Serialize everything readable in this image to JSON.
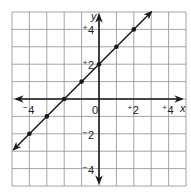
{
  "chart_data": {
    "type": "line",
    "title": "",
    "xlabel": "x",
    "ylabel": "y",
    "xlim": [
      -5,
      5
    ],
    "ylim": [
      -5,
      5
    ],
    "grid": true,
    "equation": "y = x + 2",
    "x_tick_labels": [
      {
        "value": -4,
        "sign": "−",
        "num": "4"
      },
      {
        "value": 0,
        "sign": "",
        "num": "0"
      },
      {
        "value": 2,
        "sign": "+",
        "num": "2"
      },
      {
        "value": 4,
        "sign": "+",
        "num": "4"
      }
    ],
    "y_tick_labels": [
      {
        "value": 4,
        "sign": "+",
        "num": "4"
      },
      {
        "value": 2,
        "sign": "+",
        "num": "2"
      },
      {
        "value": -2,
        "sign": "−",
        "num": "2"
      },
      {
        "value": -4,
        "sign": "−",
        "num": "4"
      }
    ],
    "series": [
      {
        "name": "line",
        "x": [
          -4,
          -3,
          -2,
          -1,
          0,
          1,
          2
        ],
        "y": [
          -2,
          -1,
          0,
          1,
          2,
          3,
          4
        ],
        "line_extent": {
          "from": [
            -4.9,
            -2.9
          ],
          "to": [
            3.0,
            5.0
          ]
        }
      }
    ],
    "colors": {
      "line": "#1a1a1a",
      "grid": "#9a9a9a",
      "background": "#ffffff"
    }
  }
}
